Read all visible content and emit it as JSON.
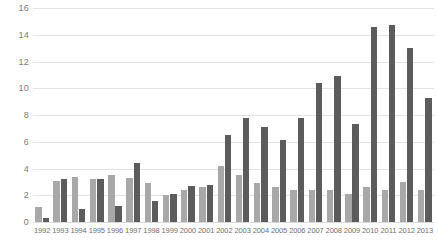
{
  "chart_data": {
    "type": "bar",
    "title": "",
    "subtitle": "",
    "xlabel": "",
    "ylabel": "",
    "ylim": [
      0,
      16
    ],
    "ytick_step": 2,
    "yticks": [
      0,
      2,
      4,
      6,
      8,
      10,
      12,
      14,
      16
    ],
    "grid": true,
    "legend_position": "none",
    "orientation": "vertical",
    "grouping": "grouped",
    "categories": [
      "1992",
      "1993",
      "1994",
      "1995",
      "1996",
      "1997",
      "1998",
      "1999",
      "2000",
      "2001",
      "2002",
      "2003",
      "2004",
      "2005",
      "2006",
      "2007",
      "2008",
      "2009",
      "2010",
      "2011",
      "2012",
      "2013"
    ],
    "series": [
      {
        "name": "Series 1",
        "color": "#a8a8a8",
        "values": [
          1.1,
          3.1,
          3.4,
          3.2,
          3.5,
          3.3,
          2.9,
          2.0,
          2.4,
          2.6,
          4.2,
          3.5,
          2.9,
          2.6,
          2.4,
          2.4,
          2.4,
          2.1,
          2.6,
          2.4,
          3.0,
          2.4
        ]
      },
      {
        "name": "Series 2",
        "color": "#5c5c5c",
        "values": [
          0.3,
          3.2,
          1.0,
          3.2,
          1.2,
          4.4,
          1.6,
          2.1,
          2.7,
          2.8,
          6.5,
          7.8,
          7.1,
          6.1,
          7.8,
          10.4,
          10.9,
          7.3,
          14.6,
          14.7,
          13.0,
          9.3
        ]
      }
    ]
  }
}
